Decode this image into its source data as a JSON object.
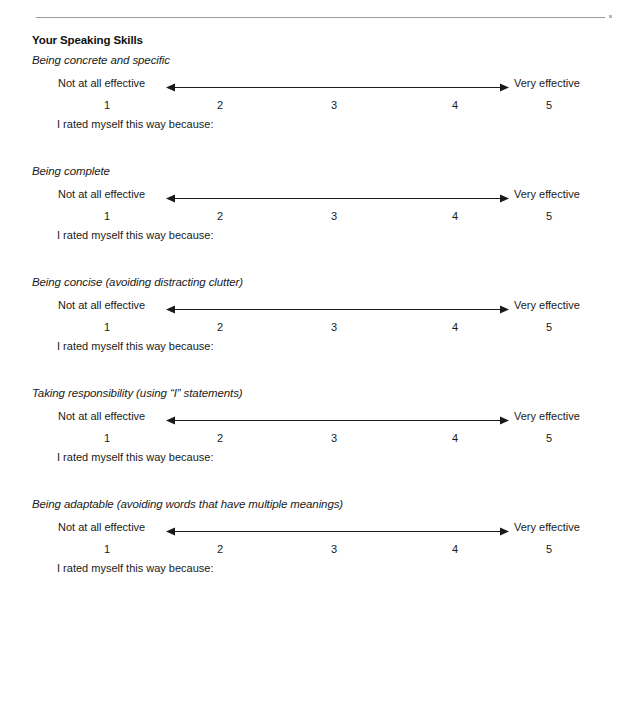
{
  "document": {
    "title": "Your Speaking Skills",
    "top_rule": {
      "present": true,
      "color": "#9a9a9a"
    },
    "margin_dot": {
      "present": true,
      "color": "#b8b8b8"
    }
  },
  "scale": {
    "left_label": "Not at all effective",
    "right_label": "Very effective",
    "ticks": [
      "1",
      "2",
      "3",
      "4",
      "5"
    ],
    "tick_positions_px": [
      107,
      220,
      334,
      455,
      549
    ],
    "axis_start_px": 166,
    "axis_end_px": 509,
    "arrow": "double-headed",
    "color": "#1a1a1a"
  },
  "prompt_label": "I rated myself this way because:",
  "items": [
    {
      "heading": "Being concrete and specific"
    },
    {
      "heading": "Being complete"
    },
    {
      "heading": "Being concise (avoiding distracting clutter)"
    },
    {
      "heading": "Taking responsibility (using “I” statements)"
    },
    {
      "heading": "Being adaptable (avoiding words that have multiple meanings)"
    }
  ]
}
